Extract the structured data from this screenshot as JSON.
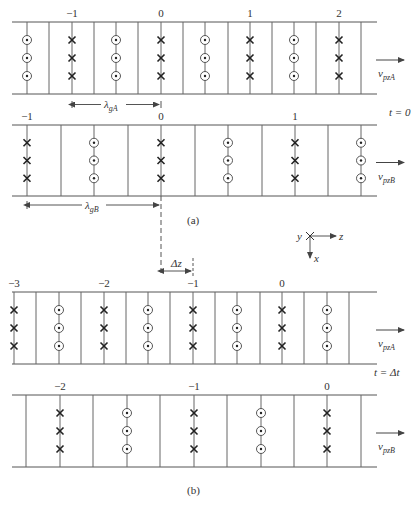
{
  "figure": {
    "caption_a": "(a)",
    "caption_b": "(b)",
    "time_a": "t = 0",
    "time_b": "t = Δt",
    "axes": {
      "y": "y",
      "z": "z",
      "x": "x"
    },
    "delta_z": "Δz",
    "lambda_gA": {
      "base": "λ",
      "sub": "gA"
    },
    "lambda_gB": {
      "base": "λ",
      "sub": "gB"
    }
  },
  "panels": [
    {
      "id": "a-guide-A",
      "top": 22,
      "bottom": 94,
      "velocity": {
        "base": "v",
        "sub": "pzA"
      },
      "lines": [
        27,
        49,
        72,
        94,
        116,
        138,
        161,
        183,
        205,
        228,
        250,
        272,
        294,
        316,
        339,
        361
      ],
      "fields": [
        {
          "x": 27,
          "type": "dot"
        },
        {
          "x": 72,
          "type": "cross",
          "label": "−1"
        },
        {
          "x": 116,
          "type": "dot"
        },
        {
          "x": 161,
          "type": "cross",
          "label": "0"
        },
        {
          "x": 205,
          "type": "dot"
        },
        {
          "x": 250,
          "type": "cross",
          "label": "1"
        },
        {
          "x": 294,
          "type": "dot"
        },
        {
          "x": 339,
          "type": "cross",
          "label": "2"
        }
      ]
    },
    {
      "id": "a-guide-B",
      "top": 125,
      "bottom": 196,
      "velocity": {
        "base": "v",
        "sub": "pzB"
      },
      "lines": [
        27,
        61,
        94,
        128,
        161,
        195,
        228,
        262,
        295,
        328,
        361
      ],
      "fields": [
        {
          "x": 27,
          "type": "cross",
          "label": "−1"
        },
        {
          "x": 94,
          "type": "dot"
        },
        {
          "x": 161,
          "type": "cross",
          "label": "0"
        },
        {
          "x": 228,
          "type": "dot"
        },
        {
          "x": 295,
          "type": "cross",
          "label": "1"
        },
        {
          "x": 361,
          "type": "dot"
        }
      ]
    },
    {
      "id": "b-guide-A",
      "top": 292,
      "bottom": 364,
      "velocity": {
        "base": "v",
        "sub": "pzA"
      },
      "lines": [
        14,
        36,
        59,
        81,
        104,
        126,
        148,
        170,
        193,
        215,
        237,
        260,
        282,
        304,
        327,
        349
      ],
      "fields": [
        {
          "x": 14,
          "type": "cross",
          "label": "−3"
        },
        {
          "x": 59,
          "type": "dot"
        },
        {
          "x": 104,
          "type": "cross",
          "label": "−2"
        },
        {
          "x": 148,
          "type": "dot"
        },
        {
          "x": 193,
          "type": "cross",
          "label": "−1"
        },
        {
          "x": 237,
          "type": "dot"
        },
        {
          "x": 282,
          "type": "cross",
          "label": "0"
        },
        {
          "x": 327,
          "type": "dot"
        }
      ]
    },
    {
      "id": "b-guide-B",
      "top": 395,
      "bottom": 467,
      "velocity": {
        "base": "v",
        "sub": "pzB"
      },
      "lines": [
        26,
        60,
        93,
        127,
        160,
        194,
        227,
        261,
        294,
        327,
        361
      ],
      "fields": [
        {
          "x": 60,
          "type": "cross",
          "label": "−2"
        },
        {
          "x": 127,
          "type": "dot"
        },
        {
          "x": 194,
          "type": "cross",
          "label": "−1"
        },
        {
          "x": 261,
          "type": "dot"
        },
        {
          "x": 327,
          "type": "cross",
          "label": "0"
        }
      ]
    }
  ]
}
